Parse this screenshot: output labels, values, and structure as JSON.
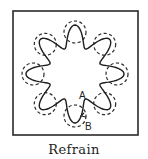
{
  "figure": {
    "caption": "Refrain",
    "labels": {
      "point_a": "A",
      "point_b": "B"
    },
    "frame": {
      "x": 13,
      "y": 11,
      "width": 125,
      "height": 124
    },
    "ring": {
      "cx": 75,
      "cy": 74,
      "radius": 42,
      "count": 8,
      "circle_radius": 11,
      "start_angle_deg": -135
    },
    "wave": {
      "cx": 75,
      "cy": 74,
      "base_radius": 38,
      "amplitude": 11,
      "lobes": 8,
      "phase_deg": 90
    },
    "colors": {
      "ink": "#1e1e1e",
      "background": "#ffffff"
    }
  }
}
